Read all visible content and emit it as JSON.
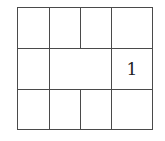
{
  "puzzle": {
    "grid_rows": 3,
    "cells": [
      {
        "row": 0,
        "x": 17,
        "y": 7,
        "w": 33,
        "h": 42,
        "value": ""
      },
      {
        "row": 0,
        "x": 49,
        "y": 7,
        "w": 32,
        "h": 42,
        "value": ""
      },
      {
        "row": 0,
        "x": 80,
        "y": 7,
        "w": 32,
        "h": 42,
        "value": ""
      },
      {
        "row": 0,
        "x": 111,
        "y": 7,
        "w": 42,
        "h": 42,
        "value": ""
      },
      {
        "row": 1,
        "x": 17,
        "y": 48,
        "w": 33,
        "h": 42,
        "value": ""
      },
      {
        "row": 1,
        "x": 49,
        "y": 48,
        "w": 63,
        "h": 42,
        "value": ""
      },
      {
        "row": 1,
        "x": 111,
        "y": 48,
        "w": 42,
        "h": 42,
        "value": "1"
      },
      {
        "row": 2,
        "x": 17,
        "y": 89,
        "w": 33,
        "h": 41,
        "value": ""
      },
      {
        "row": 2,
        "x": 49,
        "y": 89,
        "w": 32,
        "h": 41,
        "value": ""
      },
      {
        "row": 2,
        "x": 80,
        "y": 89,
        "w": 32,
        "h": 41,
        "value": ""
      },
      {
        "row": 2,
        "x": 111,
        "y": 89,
        "w": 42,
        "h": 41,
        "value": ""
      }
    ],
    "border_color": "#4a4a4a",
    "text_color": "#222222"
  }
}
